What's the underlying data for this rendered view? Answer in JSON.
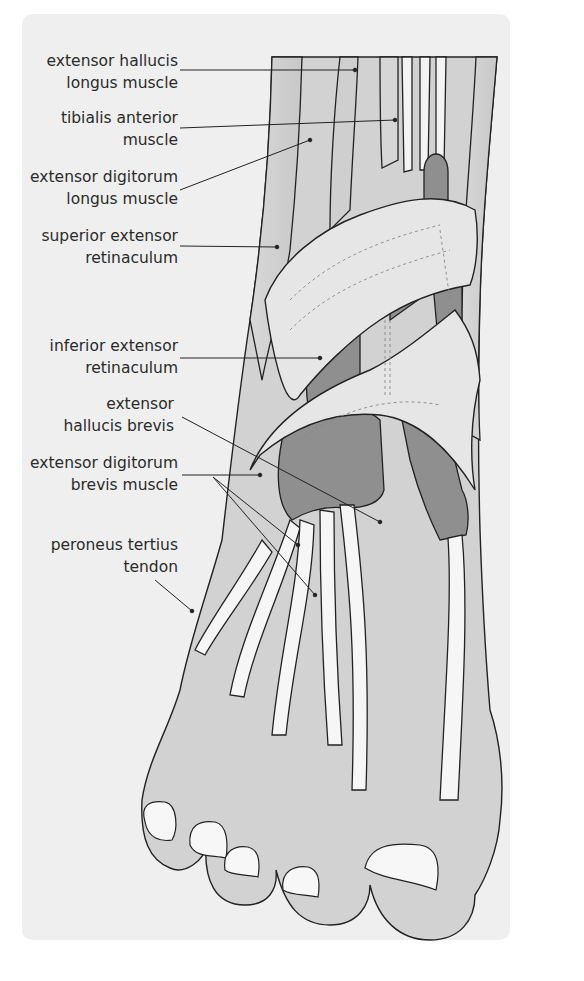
{
  "figure": {
    "colors": {
      "panel_background": "#efefef",
      "skin_fill": "#d2d2d2",
      "tendon_fill": "#f4f4f4",
      "muscle_fill": "#8f8f8f",
      "retinaculum_fill": "#e6e6e6",
      "outline": "#222222",
      "label_text": "#2b2b2b"
    }
  },
  "labels": [
    {
      "id": "ehl",
      "line1": "extensor hallucis",
      "line2": "longus muscle"
    },
    {
      "id": "ta",
      "line1": "tibialis anterior",
      "line2": "muscle"
    },
    {
      "id": "edl",
      "line1": "extensor digitorum",
      "line2": "longus muscle"
    },
    {
      "id": "ser",
      "line1": "superior extensor",
      "line2": "retinaculum"
    },
    {
      "id": "ier",
      "line1": "inferior extensor",
      "line2": "retinaculum"
    },
    {
      "id": "ehb",
      "line1": "extensor",
      "line2": "hallucis brevis"
    },
    {
      "id": "edb",
      "line1": "extensor digitorum",
      "line2": "brevis muscle"
    },
    {
      "id": "pt",
      "line1": "peroneus tertius",
      "line2": "tendon"
    }
  ]
}
